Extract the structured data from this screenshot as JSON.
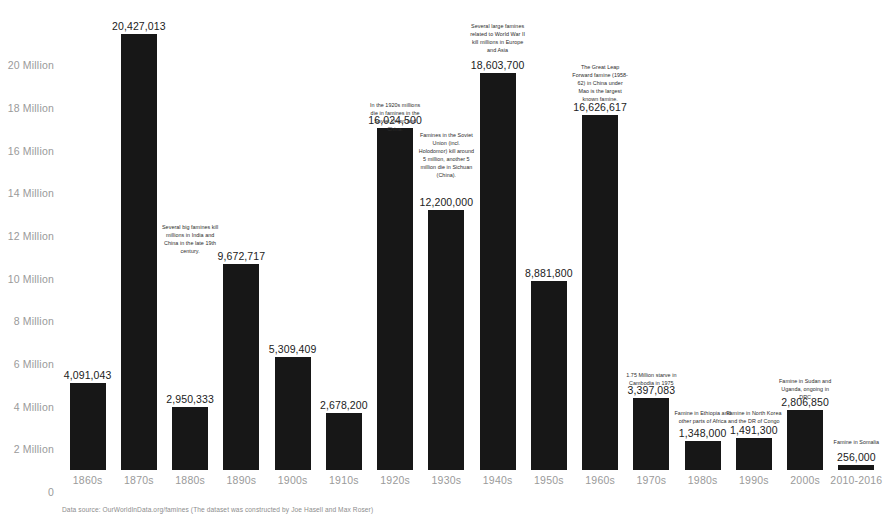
{
  "chart_data": {
    "type": "bar",
    "title": "",
    "subtitle": "",
    "xlabel": "",
    "ylabel": "",
    "ylim": [
      0,
      21000000
    ],
    "grid": false,
    "legend": "none",
    "categories": [
      "1860s",
      "1870s",
      "1880s",
      "1890s",
      "1900s",
      "1910s",
      "1920s",
      "1930s",
      "1940s",
      "1950s",
      "1960s",
      "1970s",
      "1980s",
      "1990s",
      "2000s",
      "2010-2016"
    ],
    "values": [
      4091043,
      20427013,
      2950333,
      9672717,
      5309409,
      2678200,
      16024500,
      12200000,
      18603700,
      8881800,
      16626617,
      3397083,
      1348000,
      1491300,
      2806850,
      256000
    ],
    "value_labels": [
      "4,091,043",
      "20,427,013",
      "2,950,333",
      "9,672,717",
      "5,309,409",
      "2,678,200",
      "16,024,500",
      "12,200,000",
      "18,603,700",
      "8,881,800",
      "16,626,617",
      "3,397,083",
      "1,348,000",
      "1,491,300",
      "2,806,850",
      "256,000"
    ],
    "y_ticks": [
      {
        "value": 0,
        "label": "0"
      },
      {
        "value": 2000000,
        "label": "2 Million"
      },
      {
        "value": 4000000,
        "label": "4 Million"
      },
      {
        "value": 6000000,
        "label": "6 Million"
      },
      {
        "value": 8000000,
        "label": "8 Million"
      },
      {
        "value": 10000000,
        "label": "10 Million"
      },
      {
        "value": 12000000,
        "label": "12 Million"
      },
      {
        "value": 14000000,
        "label": "14 Million"
      },
      {
        "value": 16000000,
        "label": "16 Million"
      },
      {
        "value": 18000000,
        "label": "18 Million"
      },
      {
        "value": 20000000,
        "label": "20 Million"
      }
    ],
    "annotations": [
      {
        "id": "annotation-1880s",
        "text": "Several big famines kill millions in India and China in the late 19th century.",
        "category_index": 2,
        "value_anchor": 11600000
      },
      {
        "id": "annotation-1920s",
        "text": "In the 1920s millions die in famines in the Soviet Union and China.",
        "category_index": 6,
        "value_anchor": 17300000
      },
      {
        "id": "annotation-1930s",
        "text": "Famines in the Soviet Union (incl. Holodomor) kill around 5 million, another 5 million die in Sichuan (China).",
        "category_index": 7,
        "value_anchor": 15900000
      },
      {
        "id": "annotation-1940s",
        "text": "Several large famines related to World War II kill millions in Europe and Asia",
        "category_index": 8,
        "value_anchor": 21000000
      },
      {
        "id": "annotation-1960s",
        "text": "The Great Leap Forward famine (1958-62) in China under Mao is the largest known famine.",
        "category_index": 10,
        "value_anchor": 19100000
      },
      {
        "id": "annotation-1970s",
        "text": "1.75 Million starve in Cambodia in 1975",
        "category_index": 11,
        "value_anchor": 4650000
      },
      {
        "id": "annotation-1980s",
        "text": "Famine in Ethiopia and other parts of Africa",
        "category_index": 12,
        "value_anchor": 2850000
      },
      {
        "id": "annotation-1990s",
        "text": "Famine in North Korea and the DR of Congo",
        "category_index": 13,
        "value_anchor": 2850000
      },
      {
        "id": "annotation-2000s",
        "text": "Famine in Sudan and Uganda, ongoing in DRC",
        "category_index": 14,
        "value_anchor": 4350000
      },
      {
        "id": "annotation-2010s",
        "text": "Famine in Somalia",
        "category_index": 15,
        "value_anchor": 1500000
      }
    ]
  },
  "footer": {
    "source_note": "Data source: OurWorldInData.org/famines (The dataset was constructed by Joe Hasell and Max Roser)"
  }
}
